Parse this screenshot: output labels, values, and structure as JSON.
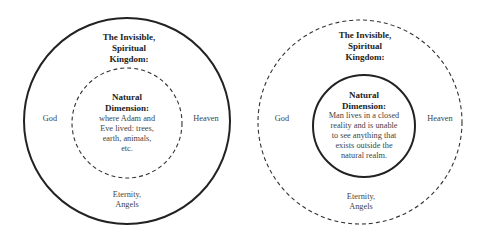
{
  "diagrams": [
    {
      "id": "left",
      "outer_circle": {
        "style": "solid",
        "cx": 127,
        "cy": 121,
        "r": 103
      },
      "inner_circle": {
        "style": "dashed",
        "cx": 127,
        "cy": 123,
        "r": 55
      },
      "outer_title": [
        "The Invisible,",
        "Spiritual",
        "Kingdom:"
      ],
      "inner_title": [
        "Natural",
        "Dimension:"
      ],
      "inner_text": [
        "where Adam and",
        "Eve lived: trees,",
        "earth, animals,",
        "etc."
      ],
      "left_label": "God",
      "right_label": "Heaven",
      "bottom_label": [
        "Eternity,",
        "Angels"
      ]
    },
    {
      "id": "right",
      "outer_circle": {
        "style": "dashed",
        "cx": 360,
        "cy": 122,
        "r": 102
      },
      "inner_circle": {
        "style": "solid",
        "cx": 364,
        "cy": 126,
        "r": 51
      },
      "outer_title": [
        "The Invisible,",
        "Spiritual",
        "Kingdom:"
      ],
      "inner_title": [
        "Natural",
        "Dimension:"
      ],
      "inner_text": [
        "Man lives in a closed",
        "reality and is unable",
        "to see anything that",
        "exists outside the",
        "natural realm."
      ],
      "left_label": "God",
      "right_label": "Heaven",
      "bottom_label": [
        "Eternity,",
        "Angels"
      ]
    }
  ]
}
